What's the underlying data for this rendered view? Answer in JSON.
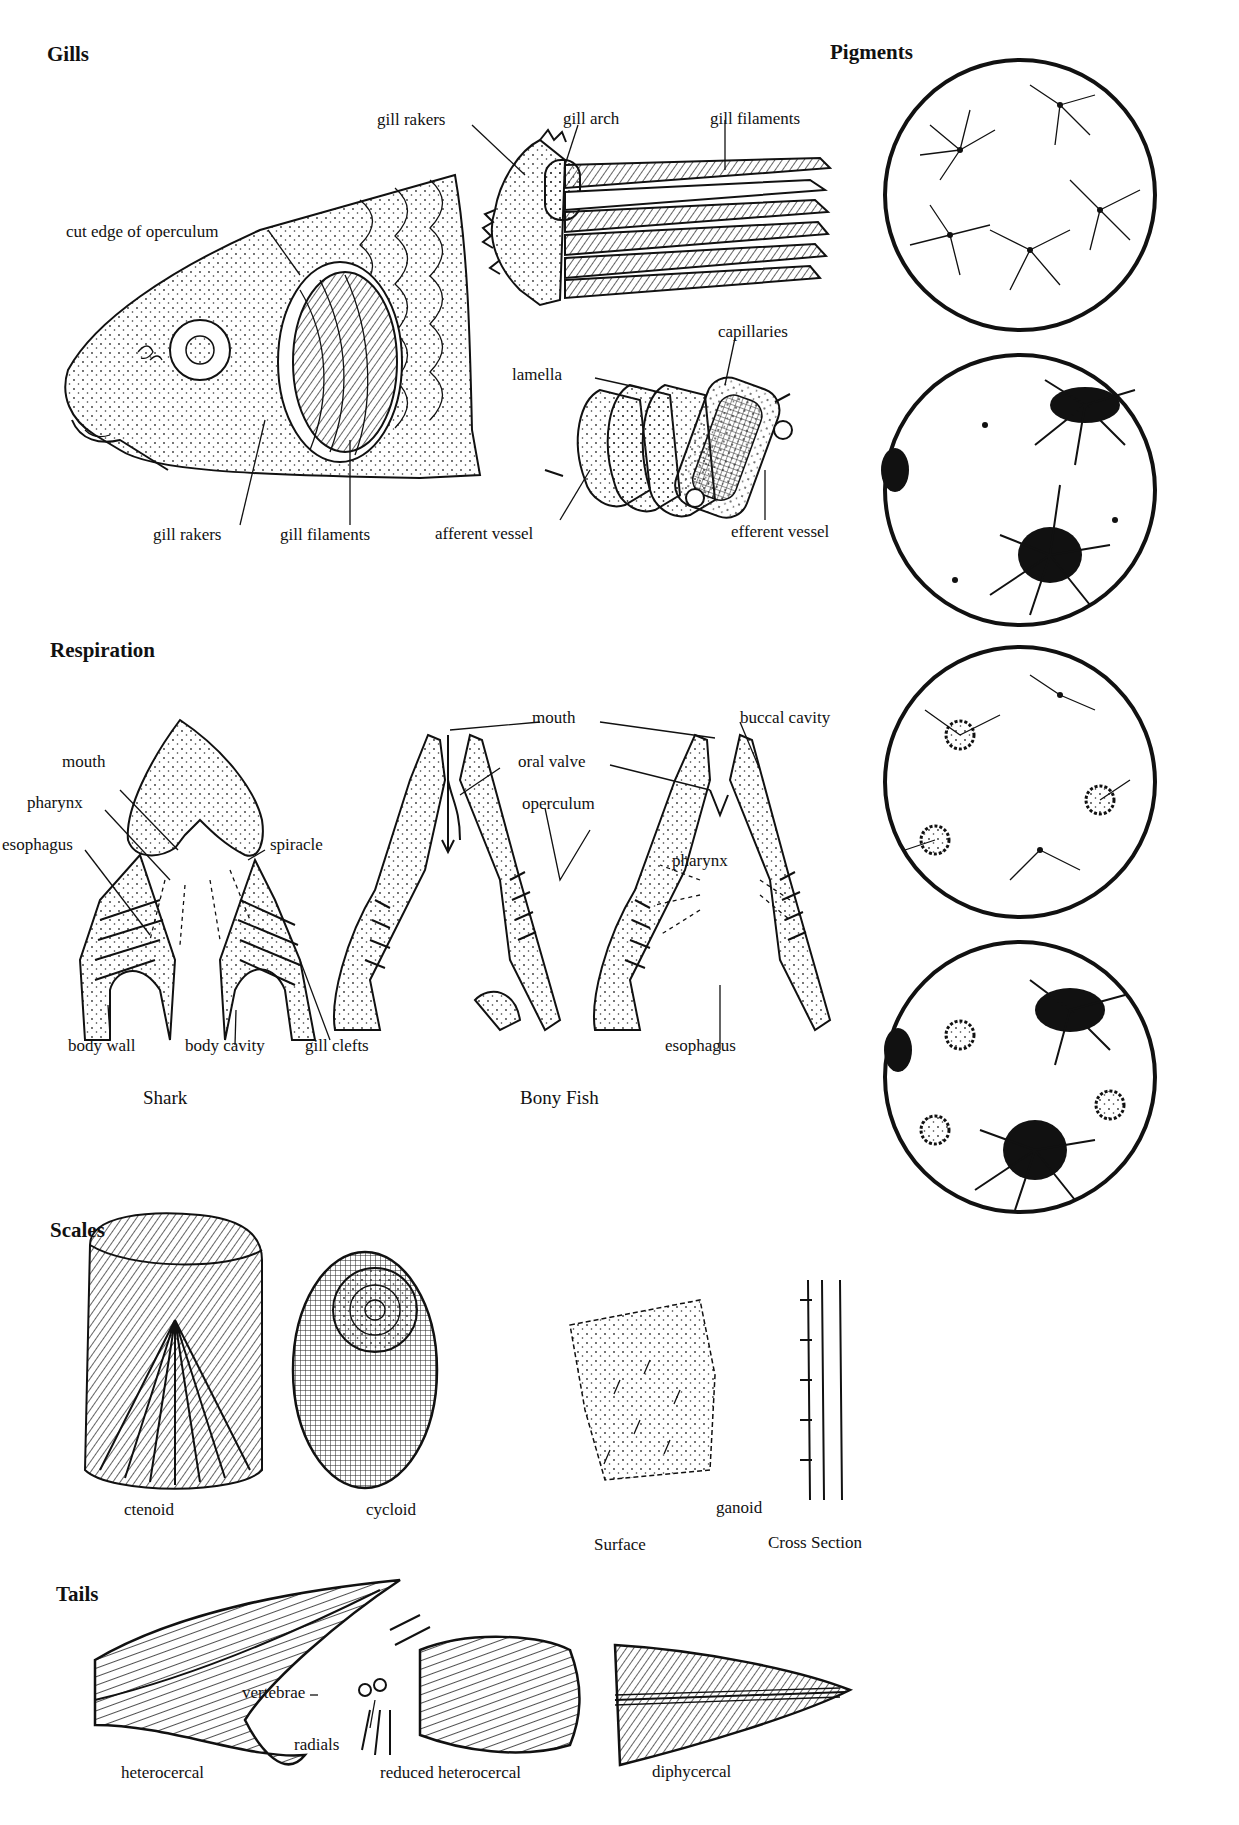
{
  "sections": {
    "gills": {
      "title": "Gills",
      "labels": {
        "gill_rakers_top": "gill rakers",
        "gill_arch": "gill arch",
        "gill_filaments_top": "gill filaments",
        "cut_edge_operculum": "cut edge of operculum",
        "capillaries": "capillaries",
        "lamella": "lamella",
        "gill_rakers_bottom": "gill rakers",
        "gill_filaments_bottom": "gill filaments",
        "afferent_vessel": "afferent vessel",
        "efferent_vessel": "efferent vessel"
      }
    },
    "pigments": {
      "title": "Pigments",
      "circles": [
        {
          "state": "contracted"
        },
        {
          "state": "partially expanded"
        },
        {
          "state": "contracted speckled"
        },
        {
          "state": "expanded"
        }
      ]
    },
    "respiration": {
      "title": "Respiration",
      "shark": {
        "caption": "Shark",
        "labels": {
          "mouth": "mouth",
          "pharynx": "pharynx",
          "esophagus": "esophagus",
          "spiracle": "spiracle",
          "body_wall": "body wall",
          "body_cavity": "body cavity",
          "gill_clefts": "gill clefts"
        }
      },
      "bony_fish": {
        "caption": "Bony Fish",
        "labels": {
          "mouth": "mouth",
          "buccal_cavity": "buccal cavity",
          "oral_valve": "oral valve",
          "operculum": "operculum",
          "pharynx": "pharynx",
          "esophagus": "esophagus"
        }
      }
    },
    "scales": {
      "title": "Scales",
      "items": [
        {
          "label": "ctenoid"
        },
        {
          "label": "cycloid"
        },
        {
          "label": "ganoid"
        }
      ],
      "ganoid_views": {
        "surface": "Surface",
        "cross_section": "Cross Section"
      }
    },
    "tails": {
      "title": "Tails",
      "items": [
        {
          "label": "heterocercal"
        },
        {
          "label": "reduced heterocercal"
        },
        {
          "label": "diphycercal"
        }
      ],
      "labels": {
        "vertebrae": "vertebrae",
        "radials": "radials"
      }
    }
  }
}
